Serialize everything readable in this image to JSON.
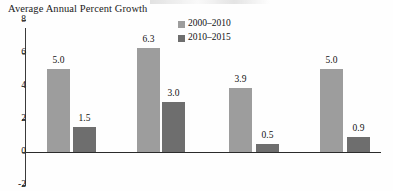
{
  "chart_data": {
    "type": "bar",
    "title": "Average Annual Percent Growth",
    "xlabel": "",
    "ylabel": "",
    "ylim": [
      -2,
      8
    ],
    "yticks": [
      8,
      6,
      4,
      2,
      0,
      -2
    ],
    "ytick_labels": [
      "8",
      "6",
      "4",
      "2",
      "0",
      "-2"
    ],
    "grid": false,
    "legend_position": "top-right",
    "categories": [
      "",
      "",
      "",
      ""
    ],
    "series": [
      {
        "name": "2000–2010",
        "color": "#9d9d9d",
        "values": [
          5.0,
          6.3,
          3.9,
          5.0
        ],
        "labels": [
          "5.0",
          "6.3",
          "3.9",
          "5.0"
        ]
      },
      {
        "name": "2010–2015",
        "color": "#6e6e6e",
        "values": [
          1.5,
          3.0,
          0.5,
          0.9
        ],
        "labels": [
          "1.5",
          "3.0",
          "0.5",
          "0.9"
        ]
      }
    ]
  },
  "legend": {
    "items": [
      {
        "label": "2000–2010",
        "color": "#9d9d9d"
      },
      {
        "label": "2010–2015",
        "color": "#6e6e6e"
      }
    ]
  },
  "axis": {
    "ticks": [
      {
        "label": "8"
      },
      {
        "label": "6"
      },
      {
        "label": "4"
      },
      {
        "label": "2"
      },
      {
        "label": "0"
      },
      {
        "label": "-2"
      }
    ]
  }
}
